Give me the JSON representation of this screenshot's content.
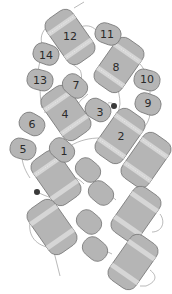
{
  "colors": {
    "pad_fill": "#b5b5b5",
    "pad_stroke": "#7a7a7a",
    "band": "#d6d6d6",
    "wire": "#8a8a8a",
    "connector": "#3a3a3a",
    "label": "#2a2a2a",
    "background": "#ffffff"
  },
  "large_pads": [
    {
      "id": "pad-12",
      "label": "12",
      "banded": true,
      "dotted": true
    },
    {
      "id": "pad-8",
      "label": "8",
      "banded": true,
      "dotted": true
    },
    {
      "id": "pad-4",
      "label": "4",
      "banded": true,
      "dotted": true
    },
    {
      "id": "pad-2",
      "label": "2",
      "banded": true,
      "dotted": true
    },
    {
      "id": "pad-unlabeled-right-upper",
      "label": "",
      "banded": true,
      "dotted": true
    },
    {
      "id": "pad-unlabeled-left-mid",
      "label": "",
      "banded": true,
      "dotted": true
    },
    {
      "id": "pad-unlabeled-right-mid",
      "label": "",
      "banded": true,
      "dotted": false
    },
    {
      "id": "pad-unlabeled-left-low",
      "label": "",
      "banded": true,
      "dotted": false
    },
    {
      "id": "pad-unlabeled-right-low",
      "label": "",
      "banded": true,
      "dotted": false
    }
  ],
  "small_pads": [
    {
      "id": "pad-11",
      "label": "11"
    },
    {
      "id": "pad-14",
      "label": "14"
    },
    {
      "id": "pad-13",
      "label": "13"
    },
    {
      "id": "pad-7",
      "label": "7"
    },
    {
      "id": "pad-10",
      "label": "10"
    },
    {
      "id": "pad-9",
      "label": "9"
    },
    {
      "id": "pad-3",
      "label": "3"
    },
    {
      "id": "pad-6",
      "label": "6"
    },
    {
      "id": "pad-5",
      "label": "5"
    },
    {
      "id": "pad-1",
      "label": "1"
    },
    {
      "id": "pad-unlabeled-a",
      "label": ""
    },
    {
      "id": "pad-unlabeled-b",
      "label": ""
    },
    {
      "id": "pad-unlabeled-c",
      "label": ""
    },
    {
      "id": "pad-unlabeled-d",
      "label": ""
    }
  ],
  "connectors": [
    {
      "id": "connector-upper",
      "note": "near pad 3"
    },
    {
      "id": "connector-lower",
      "note": "left of lower-left pad"
    }
  ]
}
